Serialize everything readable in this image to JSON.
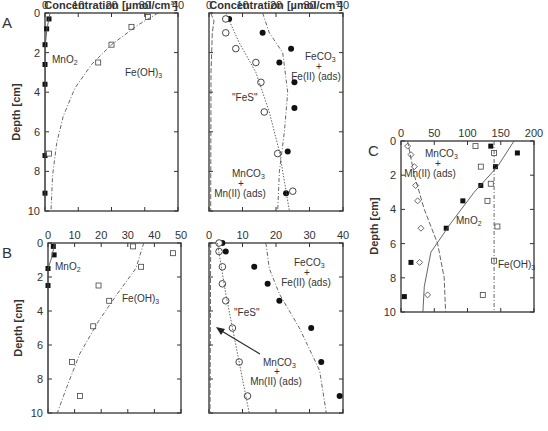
{
  "figure": {
    "top_axis_title": "Concentration [µmol/cm³]",
    "depth_label": "Depth [cm]"
  },
  "chart_data": [
    {
      "panel": "A-left",
      "type": "scatter",
      "xlabel": "Concentration [µmol/cm³]",
      "ylabel": "Depth [cm]",
      "xlim": [
        0,
        40
      ],
      "ylim": [
        10,
        0
      ],
      "xticks": [
        0,
        10,
        20,
        30,
        40
      ],
      "yticks": [
        0,
        2,
        4,
        6,
        8,
        10
      ],
      "series": [
        {
          "name": "MnO2",
          "marker": "filled-square",
          "points": [
            [
              1.2,
              0.3
            ],
            [
              0.5,
              0.8
            ],
            [
              0,
              1.6
            ],
            [
              0,
              2.6
            ],
            [
              0,
              3.6
            ],
            [
              0,
              7.2
            ],
            [
              0,
              9.1
            ]
          ]
        },
        {
          "name": "Fe(OH)3",
          "marker": "open-square",
          "points": [
            [
              31,
              0.2
            ],
            [
              26,
              0.7
            ],
            [
              20,
              1.6
            ],
            [
              16,
              2.5
            ],
            [
              1.2,
              7.1
            ]
          ]
        },
        {
          "name": "Fe(OH)3 model",
          "type": "line",
          "points": [
            [
              34,
              0
            ],
            [
              28,
              0.6
            ],
            [
              20,
              1.6
            ],
            [
              14,
              2.6
            ],
            [
              9,
              3.8
            ],
            [
              5.5,
              5.2
            ],
            [
              3.5,
              6.6
            ],
            [
              2.3,
              8.2
            ],
            [
              1.8,
              10
            ]
          ]
        },
        {
          "name": "MnO2 model",
          "type": "line",
          "points": [
            [
              1.5,
              0
            ],
            [
              0.6,
              0.8
            ],
            [
              0.1,
              1.6
            ],
            [
              0,
              10
            ]
          ]
        }
      ],
      "annotations": [
        "MnO₂",
        "Fe(OH)₃"
      ]
    },
    {
      "panel": "A-right",
      "type": "scatter",
      "xlabel": "Concentration [µmol/cm³]",
      "xlim": [
        0,
        40
      ],
      "ylim": [
        10,
        0
      ],
      "xticks": [
        0,
        10,
        20,
        30,
        40
      ],
      "series": [
        {
          "name": "FeCO3 + Fe(II) (ads)",
          "marker": "filled-circle",
          "points": [
            [
              6,
              0.3
            ],
            [
              16,
              1.0
            ],
            [
              24.5,
              1.8
            ],
            [
              21,
              2.5
            ],
            [
              25.5,
              3.5
            ],
            [
              25.5,
              4.8
            ],
            [
              23.5,
              7.0
            ],
            [
              23,
              9.1
            ]
          ]
        },
        {
          "name": "FeS",
          "marker": "open-circle",
          "points": [
            [
              5,
              0.3
            ],
            [
              5,
              1.0
            ],
            [
              8,
              1.8
            ],
            [
              14,
              2.5
            ],
            [
              15.5,
              3.5
            ],
            [
              16.5,
              5.0
            ],
            [
              20.5,
              7.1
            ],
            [
              25,
              9.0
            ]
          ]
        },
        {
          "name": "FeS model",
          "type": "line",
          "points": [
            [
              5,
              0
            ],
            [
              9,
              1.5
            ],
            [
              14,
              3
            ],
            [
              18,
              5
            ],
            [
              21,
              7
            ],
            [
              24,
              10
            ]
          ]
        },
        {
          "name": "FeCO3 model",
          "type": "line",
          "points": [
            [
              16,
              0
            ],
            [
              18,
              1
            ],
            [
              22,
              2
            ],
            [
              23.5,
              4
            ],
            [
              22.5,
              6
            ],
            [
              21,
              8
            ],
            [
              20.5,
              10
            ]
          ]
        },
        {
          "name": "MnCO3 model",
          "type": "line",
          "points": [
            [
              0.5,
              0
            ],
            [
              1.5,
              0.4
            ],
            [
              1,
              1
            ],
            [
              0.6,
              3
            ],
            [
              0.5,
              10
            ]
          ]
        }
      ],
      "annotations": [
        "FeCO₃ + Fe(II) (ads)",
        "\"FeS\"",
        "MnCO₃ + Mn(II) (ads)"
      ]
    },
    {
      "panel": "B-left",
      "type": "scatter",
      "xlabel": "",
      "ylabel": "Depth [cm]",
      "xlim": [
        0,
        50
      ],
      "ylim": [
        10,
        0
      ],
      "xticks": [
        0,
        10,
        20,
        30,
        40,
        50
      ],
      "yticks": [
        0,
        2,
        4,
        6,
        8,
        10
      ],
      "series": [
        {
          "name": "MnO2",
          "marker": "filled-square",
          "points": [
            [
              2,
              0.2
            ],
            [
              2.3,
              0.7
            ],
            [
              0,
              1.5
            ],
            [
              0,
              2.5
            ]
          ]
        },
        {
          "name": "Fe(OH)3",
          "marker": "open-square",
          "points": [
            [
              32,
              0.2
            ],
            [
              47,
              0.6
            ],
            [
              35,
              1.4
            ],
            [
              19,
              2.5
            ],
            [
              23,
              3.4
            ],
            [
              17,
              4.9
            ],
            [
              9,
              7.0
            ],
            [
              12,
              9.0
            ]
          ]
        },
        {
          "name": "Fe(OH)3 model",
          "type": "line",
          "points": [
            [
              36,
              0
            ],
            [
              33,
              1.5
            ],
            [
              26,
              3
            ],
            [
              19,
              4.6
            ],
            [
              12,
              6.5
            ],
            [
              7,
              8.5
            ],
            [
              3.5,
              10
            ]
          ]
        },
        {
          "name": "MnO2 model",
          "type": "line",
          "points": [
            [
              2.5,
              0
            ],
            [
              1.5,
              0.8
            ],
            [
              0,
              1.5
            ],
            [
              0,
              10
            ]
          ]
        }
      ],
      "annotations": [
        "MnO₂",
        "Fe(OH)₃"
      ]
    },
    {
      "panel": "B-right",
      "type": "scatter",
      "xlim": [
        0,
        40
      ],
      "ylim": [
        10,
        0
      ],
      "xticks": [
        0,
        10,
        20,
        30,
        40
      ],
      "series": [
        {
          "name": "FeCO3 + Fe(II) (ads)",
          "marker": "filled-circle",
          "points": [
            [
              4,
              0
            ],
            [
              5,
              0.5
            ],
            [
              13.5,
              1.4
            ],
            [
              17.5,
              2.4
            ],
            [
              21,
              3.4
            ],
            [
              30.5,
              5.0
            ],
            [
              33.5,
              7.0
            ],
            [
              39,
              9.0
            ]
          ]
        },
        {
          "name": "FeS",
          "marker": "open-circle",
          "points": [
            [
              3,
              0
            ],
            [
              3,
              0.5
            ],
            [
              4,
              1.4
            ],
            [
              4,
              2.4
            ],
            [
              5,
              3.4
            ],
            [
              7,
              5.0
            ],
            [
              9,
              7.0
            ],
            [
              11.5,
              9.0
            ]
          ]
        },
        {
          "name": "FeS model",
          "type": "line",
          "points": [
            [
              2.5,
              0
            ],
            [
              5,
              3
            ],
            [
              8,
              6
            ],
            [
              12,
              10
            ]
          ]
        },
        {
          "name": "FeCO3 model",
          "type": "line",
          "points": [
            [
              17,
              0
            ],
            [
              18,
              1.5
            ],
            [
              21,
              3
            ],
            [
              27,
              5
            ],
            [
              33,
              7.5
            ],
            [
              35,
              10
            ]
          ]
        },
        {
          "name": "MnCO3 model",
          "type": "line",
          "points": [
            [
              0.5,
              0
            ],
            [
              0.3,
              10
            ]
          ]
        }
      ],
      "annotations": [
        "FeCO₃ + Fe(II) (ads)",
        "\"FeS\"",
        "MnCO₃ + Mn(II) (ads)"
      ]
    },
    {
      "panel": "C",
      "type": "scatter",
      "ylabel": "Depth [cm]",
      "xlim": [
        0,
        200
      ],
      "ylim": [
        10,
        0
      ],
      "xticks": [
        0,
        50,
        100,
        150,
        200
      ],
      "yticks": [
        0,
        2,
        4,
        6,
        8,
        10
      ],
      "series": [
        {
          "name": "MnCO3 + Mn(II) (ads)",
          "marker": "open-diamond",
          "points": [
            [
              10,
              0.3
            ],
            [
              15,
              0.8
            ],
            [
              20,
              1.5
            ],
            [
              22,
              2.6
            ],
            [
              25,
              3.5
            ],
            [
              30,
              5.1
            ],
            [
              28,
              7.1
            ],
            [
              40,
              9.0
            ]
          ]
        },
        {
          "name": "MnO2",
          "marker": "filled-square",
          "points": [
            [
              135,
              0.3
            ],
            [
              175,
              0.7
            ],
            [
              142,
              1.5
            ],
            [
              120,
              2.6
            ],
            [
              93,
              3.5
            ],
            [
              68,
              5.1
            ],
            [
              15,
              7.1
            ],
            [
              5,
              9.1
            ]
          ]
        },
        {
          "name": "Fe(OH)3",
          "marker": "open-square",
          "points": [
            [
              112,
              0.3
            ],
            [
              140,
              0.7
            ],
            [
              120,
              1.5
            ],
            [
              135,
              2.5
            ],
            [
              130,
              3.5
            ],
            [
              145,
              5.0
            ],
            [
              140,
              7.0
            ],
            [
              123,
              9.0
            ]
          ]
        },
        {
          "name": "MnCO3 model",
          "type": "line",
          "points": [
            [
              10,
              0
            ],
            [
              20,
              2
            ],
            [
              35,
              4
            ],
            [
              55,
              6
            ],
            [
              65,
              8
            ],
            [
              67,
              10
            ]
          ]
        },
        {
          "name": "MnO2 model",
          "type": "line",
          "points": [
            [
              170,
              0
            ],
            [
              145,
              1.5
            ],
            [
              110,
              3
            ],
            [
              75,
              4.8
            ],
            [
              45,
              6.5
            ],
            [
              35,
              8.5
            ],
            [
              33,
              10
            ]
          ]
        },
        {
          "name": "Fe(OH)3 model",
          "type": "line",
          "points": [
            [
              140,
              0
            ],
            [
              140,
              10
            ]
          ]
        }
      ],
      "annotations": [
        "MnCO₃ + Mn(II) (ads)",
        "MnO₂",
        "Fe(OH)₃"
      ]
    }
  ],
  "panels": {
    "A": {
      "letter": "A"
    },
    "B": {
      "letter": "B"
    },
    "C": {
      "letter": "C"
    }
  },
  "labels": {
    "mno2": "MnO",
    "feoh": "Fe(OH)",
    "feco3": "FeCO",
    "feii": "Fe(II) (ads)",
    "plus": "+",
    "fes": "\"FeS\"",
    "mnco3": "MnCO",
    "mnii": "Mn(II) (ads)",
    "sub2": "2",
    "sub3": "3"
  }
}
